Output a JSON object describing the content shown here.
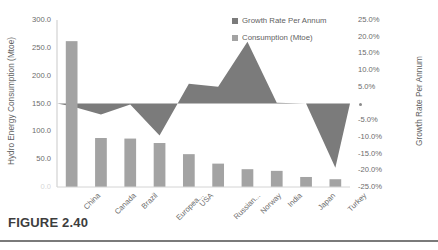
{
  "figure": {
    "caption": "FIGURE 2.40"
  },
  "legend": {
    "position": "top-right",
    "items": [
      {
        "label": "Growth Rate Per Annum",
        "color": "#7b7b7b",
        "swatch_name": "legend-swatch-growth"
      },
      {
        "label": "Consumption (Mtoe)",
        "color": "#a3a3a3",
        "swatch_name": "legend-swatch-consumption"
      }
    ]
  },
  "chart_data": {
    "type": "bar",
    "title": "",
    "xlabel": "",
    "ylabel": "Hydro Energy Consumption (Mtoe)",
    "y2label": "Growth Rate Per Annum",
    "grid": false,
    "categories": [
      "China",
      "Canada",
      "Brazil",
      "Europea...",
      "USA",
      "Russian...",
      "Norway",
      "India",
      "Japan",
      "Turkey"
    ],
    "ylim": [
      0,
      300
    ],
    "y2lim": [
      -25,
      25
    ],
    "yticks": [
      "300.0",
      "250.0",
      "200.0",
      "150.0",
      "100.0",
      "50.0",
      "0.0"
    ],
    "ytick_values": [
      300,
      250,
      200,
      150,
      100,
      50,
      0
    ],
    "y2ticks": [
      "25.0%",
      "20.0%",
      "15.0%",
      "10.0%",
      "5.0%",
      "0.0%",
      "-5.0%",
      "-10.0%",
      "-15.0%",
      "-20.0%",
      "-25.0%"
    ],
    "y2tick_values": [
      25,
      20,
      15,
      10,
      5,
      0,
      -5,
      -10,
      -15,
      -20,
      -25
    ],
    "series": [
      {
        "name": "Consumption (Mtoe)",
        "type": "bar",
        "axis": "left",
        "unit": "Mtoe",
        "color": "#a3a3a3",
        "values": [
          262,
          88,
          87,
          79,
          59,
          42,
          32,
          29,
          18,
          14
        ]
      },
      {
        "name": "Growth Rate Per Annum",
        "type": "area",
        "axis": "right",
        "unit": "%",
        "color": "#7b7b7b",
        "values": [
          -0.8,
          -3.3,
          -0.3,
          -9.6,
          5.9,
          5.0,
          18.5,
          0.2,
          0.0,
          -19.2
        ]
      }
    ]
  }
}
